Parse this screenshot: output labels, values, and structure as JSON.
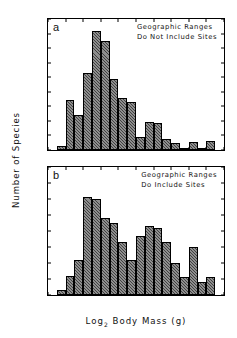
{
  "figure": {
    "ylabel": "Number of Species",
    "xlabel_prefix": "Log",
    "xlabel_sub": "2",
    "xlabel_suffix": " Body Mass (g)"
  },
  "chart_data": [
    {
      "type": "bar",
      "panel": "a",
      "panel_letter": "a",
      "title": "",
      "annotation_line1": "Geographic Ranges",
      "annotation_line2": "Do Not Include Sites",
      "xlabel": "Log2 Body Mass (g)",
      "ylabel": "Number of Species",
      "xlim": [
        0,
        20
      ],
      "ylim": [
        0,
        1800
      ],
      "xticks": [
        0,
        2,
        4,
        6,
        8,
        10,
        12,
        14,
        16,
        18,
        20
      ],
      "yticks": [
        0,
        200,
        400,
        600,
        800,
        1000,
        1200,
        1400,
        1600,
        1800
      ],
      "grid": false,
      "bin_width": 1,
      "bin_starts": [
        1,
        2,
        3,
        4,
        5,
        6,
        7,
        8,
        9,
        10,
        11,
        12,
        13,
        14,
        15,
        16,
        17,
        18,
        19
      ],
      "categories": [
        "1-2",
        "2-3",
        "3-4",
        "4-5",
        "5-6",
        "6-7",
        "7-8",
        "8-9",
        "9-10",
        "10-11",
        "11-12",
        "12-13",
        "13-14",
        "14-15",
        "15-16",
        "16-17",
        "17-18",
        "18-19",
        "19-20"
      ],
      "values": [
        60,
        690,
        480,
        1060,
        1630,
        1500,
        980,
        710,
        660,
        180,
        380,
        375,
        145,
        100,
        25,
        110,
        20,
        130,
        0
      ]
    },
    {
      "type": "bar",
      "panel": "b",
      "panel_letter": "b",
      "title": "",
      "annotation_line1": "Geographic Ranges",
      "annotation_line2": "Do Include Sites",
      "xlabel": "Log2 Body Mass (g)",
      "ylabel": "Number of Species",
      "xlim": [
        0,
        20
      ],
      "ylim": [
        0,
        80
      ],
      "xticks": [
        0,
        2,
        4,
        6,
        8,
        10,
        12,
        14,
        16,
        18,
        20
      ],
      "yticks": [
        0,
        10,
        20,
        30,
        40,
        50,
        60,
        70,
        80
      ],
      "grid": false,
      "bin_width": 1,
      "bin_starts": [
        1,
        2,
        3,
        4,
        5,
        6,
        7,
        8,
        9,
        10,
        11,
        12,
        13,
        14,
        15,
        16,
        17,
        18,
        19
      ],
      "categories": [
        "1-2",
        "2-3",
        "3-4",
        "4-5",
        "5-6",
        "6-7",
        "7-8",
        "8-9",
        "9-10",
        "10-11",
        "11-12",
        "12-13",
        "13-14",
        "14-15",
        "15-16",
        "16-17",
        "17-18",
        "18-19",
        "19-20"
      ],
      "values": [
        3,
        12,
        22,
        61,
        60,
        48,
        45,
        33,
        22,
        37,
        43,
        42,
        33,
        20,
        11,
        30,
        8,
        11,
        0
      ]
    }
  ],
  "style": {
    "bar_fill": "#8e8e8e",
    "axis_color": "#000000",
    "background": "#ffffff"
  }
}
